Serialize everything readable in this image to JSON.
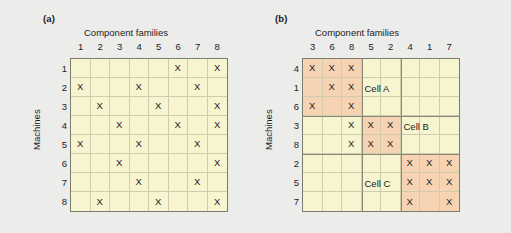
{
  "figure": {
    "background_color": "#ececeb",
    "cell_fill_plain": "#f7f4d0",
    "cell_fill_shaded": "#f6d3b2",
    "mark_symbol": "X"
  },
  "panel_a": {
    "label": "(a)",
    "x_axis_title": "Component families",
    "y_axis_title": "Machines",
    "column_headers": [
      "1",
      "2",
      "3",
      "4",
      "5",
      "6",
      "7",
      "8"
    ],
    "row_headers": [
      "1",
      "2",
      "3",
      "4",
      "5",
      "6",
      "7",
      "8"
    ],
    "matrix": [
      [
        "",
        "",
        "",
        "",
        "",
        "X",
        "",
        "X"
      ],
      [
        "X",
        "",
        "",
        "X",
        "",
        "",
        "X",
        ""
      ],
      [
        "",
        "X",
        "",
        "",
        "X",
        "",
        "",
        "X"
      ],
      [
        "",
        "",
        "X",
        "",
        "",
        "X",
        "",
        "X"
      ],
      [
        "X",
        "",
        "",
        "X",
        "",
        "",
        "X",
        ""
      ],
      [
        "",
        "",
        "X",
        "",
        "",
        "",
        "",
        "X"
      ],
      [
        "",
        "",
        "",
        "X",
        "",
        "",
        "X",
        ""
      ],
      [
        "",
        "X",
        "",
        "",
        "X",
        "",
        "",
        "X"
      ]
    ]
  },
  "panel_b": {
    "label": "(b)",
    "x_axis_title": "Component families",
    "y_axis_title": "Machines",
    "column_headers": [
      "3",
      "6",
      "8",
      "5",
      "2",
      "4",
      "1",
      "7"
    ],
    "row_headers": [
      "4",
      "1",
      "6",
      "3",
      "8",
      "2",
      "5",
      "7"
    ],
    "matrix": [
      [
        "X",
        "X",
        "X",
        "",
        "",
        "",
        "",
        ""
      ],
      [
        "",
        "X",
        "X",
        "",
        "",
        "",
        "",
        ""
      ],
      [
        "X",
        "",
        "X",
        "",
        "",
        "",
        "",
        ""
      ],
      [
        "",
        "",
        "X",
        "X",
        "X",
        "",
        "",
        ""
      ],
      [
        "",
        "",
        "X",
        "X",
        "X",
        "",
        "",
        ""
      ],
      [
        "",
        "",
        "",
        "",
        "",
        "X",
        "X",
        "X"
      ],
      [
        "",
        "",
        "",
        "",
        "",
        "X",
        "X",
        "X"
      ],
      [
        "",
        "",
        "",
        "",
        "",
        "X",
        "",
        "X"
      ]
    ],
    "shading": [
      [
        1,
        1,
        1,
        0,
        0,
        0,
        0,
        0
      ],
      [
        1,
        1,
        1,
        0,
        0,
        0,
        0,
        0
      ],
      [
        1,
        1,
        1,
        0,
        0,
        0,
        0,
        0
      ],
      [
        0,
        0,
        0,
        1,
        1,
        0,
        0,
        0
      ],
      [
        0,
        0,
        0,
        1,
        1,
        0,
        0,
        0
      ],
      [
        0,
        0,
        0,
        0,
        0,
        1,
        1,
        1
      ],
      [
        0,
        0,
        0,
        0,
        0,
        1,
        1,
        1
      ],
      [
        0,
        0,
        0,
        0,
        0,
        1,
        1,
        1
      ]
    ],
    "cell_labels": [
      {
        "text": "Cell A",
        "row": 1,
        "col": 3
      },
      {
        "text": "Cell B",
        "row": 3,
        "col": 5
      },
      {
        "text": "Cell C",
        "row": 6,
        "col": 3
      }
    ]
  }
}
